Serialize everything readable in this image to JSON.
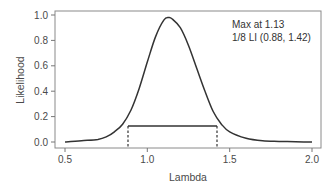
{
  "chart_data": {
    "type": "line",
    "title": "",
    "xlabel": "Lambda",
    "ylabel": "Likelihood",
    "xlim": [
      0.45,
      2.05
    ],
    "ylim": [
      -0.03,
      1.05
    ],
    "x_ticks": [
      "0.5",
      "1.0",
      "1.5",
      "2.0"
    ],
    "y_ticks": [
      "0.0",
      "0.2",
      "0.4",
      "0.6",
      "0.8",
      "1.0"
    ],
    "grid": false,
    "legend": null,
    "series": [
      {
        "name": "Likelihood",
        "x": [
          0.5,
          0.6,
          0.7,
          0.75,
          0.8,
          0.85,
          0.9,
          0.95,
          1.0,
          1.05,
          1.1,
          1.13,
          1.15,
          1.2,
          1.25,
          1.3,
          1.35,
          1.4,
          1.45,
          1.5,
          1.6,
          1.7,
          1.8,
          1.9,
          2.0
        ],
        "y": [
          0.0,
          0.01,
          0.02,
          0.04,
          0.08,
          0.14,
          0.25,
          0.42,
          0.63,
          0.83,
          0.96,
          0.98,
          0.97,
          0.9,
          0.76,
          0.58,
          0.4,
          0.24,
          0.14,
          0.08,
          0.03,
          0.01,
          0.005,
          0.002,
          0.0
        ]
      }
    ],
    "annotations": [
      {
        "text": "Max at 1.13",
        "position": "top-right"
      },
      {
        "text": "1/8 LI (0.88, 1.42)",
        "position": "top-right"
      }
    ],
    "likelihood_interval": {
      "level": 0.125,
      "lower": 0.88,
      "upper": 1.42,
      "style": "horizontal solid line with dashed verticals to x-axis"
    },
    "max_lambda": 1.13
  },
  "labels": {
    "xlabel": "Lambda",
    "ylabel": "Likelihood",
    "annot_max": "Max at 1.13",
    "annot_li": "1/8 LI (0.88, 1.42)",
    "x_ticks": [
      "0.5",
      "1.0",
      "1.5",
      "2.0"
    ],
    "y_ticks": [
      "0.0",
      "0.2",
      "0.4",
      "0.6",
      "0.8",
      "1.0"
    ]
  },
  "colors": {
    "curve": "#333333",
    "axis": "#777777",
    "text": "#4a4a4a"
  }
}
